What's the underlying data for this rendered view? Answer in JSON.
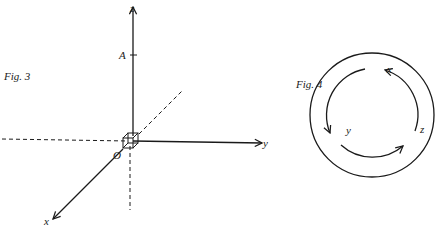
{
  "fig3": {
    "caption": "Fig. 3",
    "origin_label": "O",
    "point_label": "A",
    "axes": [
      {
        "name": "x",
        "label": "x",
        "direction": "down-left"
      },
      {
        "name": "y",
        "label": "y",
        "direction": "right"
      },
      {
        "name": "z",
        "label": "z",
        "direction": "up"
      }
    ],
    "negative_axes_style": "dashed"
  },
  "fig4": {
    "caption": "Fig. 4",
    "cycle_labels": [
      "x",
      "y",
      "z"
    ],
    "cycle_direction": "x → y → z → x (counterclockwise)"
  },
  "colors": {
    "ink": "#1a1a1a",
    "background": "#ffffff"
  }
}
